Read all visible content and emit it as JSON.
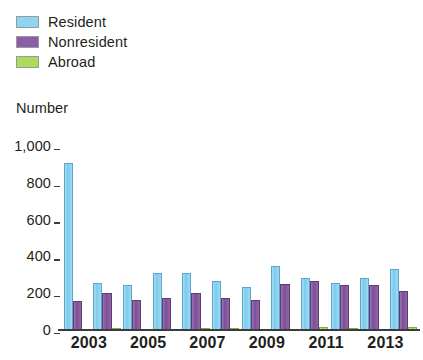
{
  "legend": {
    "items": [
      {
        "label": "Resident",
        "color": "#8FD4F0",
        "key": "resident"
      },
      {
        "label": "Nonresident",
        "color": "#8B5FA8",
        "key": "nonresident"
      },
      {
        "label": "Abroad",
        "color": "#A8DC5A",
        "key": "abroad"
      }
    ]
  },
  "axis": {
    "y_title": "Number",
    "y_ticks": [
      "1,000",
      "800",
      "600",
      "400",
      "200",
      "0"
    ]
  },
  "chart_data": {
    "type": "bar",
    "title": "",
    "subtitle": "",
    "xlabel": "",
    "ylabel": "Number",
    "ylim": [
      0,
      1000
    ],
    "yticks": [
      0,
      200,
      400,
      600,
      800,
      1000
    ],
    "grid": false,
    "legend_position": "top-left",
    "categories": [
      "2003",
      "2004",
      "2005",
      "2006",
      "2007",
      "2008",
      "2009",
      "2010",
      "2011",
      "2012",
      "2013",
      "2014"
    ],
    "tick_labels_shown": [
      "2003",
      "2005",
      "2007",
      "2009",
      "2011",
      "2013"
    ],
    "series": [
      {
        "name": "Resident",
        "color": "#8FD4F0",
        "values": [
          910,
          255,
          245,
          310,
          310,
          265,
          235,
          350,
          285,
          255,
          280,
          330
        ]
      },
      {
        "name": "Nonresident",
        "color": "#8B5FA8",
        "values": [
          155,
          200,
          165,
          175,
          200,
          175,
          165,
          250,
          265,
          245,
          245,
          210
        ]
      },
      {
        "name": "Abroad",
        "color": "#A8DC5A",
        "values": [
          0,
          12,
          0,
          0,
          5,
          12,
          0,
          0,
          15,
          12,
          0,
          18
        ]
      }
    ]
  }
}
